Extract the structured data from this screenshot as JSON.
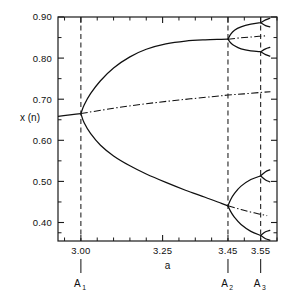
{
  "chart_data": {
    "type": "line",
    "title": "",
    "xlabel": "a",
    "ylabel": "x (n)",
    "xlim": [
      2.93,
      3.6
    ],
    "ylim": [
      0.355,
      0.9
    ],
    "grid": false,
    "legend": "none",
    "xticks_labeled": [
      "3.00",
      "3.25",
      "3.45",
      "3.55"
    ],
    "xtick_values": [
      3.0,
      3.25,
      3.45,
      3.55
    ],
    "yticks_labeled": [
      "0.90",
      "0.80",
      "0.70",
      "0.60",
      "0.50",
      "0.40"
    ],
    "ytick_values": [
      0.9,
      0.8,
      0.7,
      0.6,
      0.5,
      0.4
    ],
    "annotations": [
      {
        "label": "A",
        "sub": "1",
        "x": 3.0,
        "note": "period-1 to period-2 bifurcation"
      },
      {
        "label": "A",
        "sub": "2",
        "x": 3.45,
        "note": "period-2 to period-4 bifurcation"
      },
      {
        "label": "A",
        "sub": "3",
        "x": 3.55,
        "note": "period-4 to period-8 bifurcation"
      }
    ],
    "series": [
      {
        "name": "fixed-point-stable",
        "style": "solid",
        "points": [
          [
            2.93,
            0.658
          ],
          [
            2.96,
            0.661
          ],
          [
            2.985,
            0.6635
          ],
          [
            3.0,
            0.665
          ]
        ]
      },
      {
        "name": "fixed-point-unstable",
        "style": "dash-dot",
        "points": [
          [
            3.0,
            0.665
          ],
          [
            3.1,
            0.678
          ],
          [
            3.2,
            0.689
          ],
          [
            3.3,
            0.698
          ],
          [
            3.4,
            0.706
          ],
          [
            3.45,
            0.71
          ],
          [
            3.5,
            0.713
          ],
          [
            3.55,
            0.7165
          ],
          [
            3.58,
            0.718
          ]
        ]
      },
      {
        "name": "period2-upper-stable",
        "style": "solid",
        "points": [
          [
            3.0,
            0.665
          ],
          [
            3.01,
            0.686
          ],
          [
            3.03,
            0.714
          ],
          [
            3.06,
            0.745
          ],
          [
            3.1,
            0.776
          ],
          [
            3.15,
            0.803
          ],
          [
            3.2,
            0.8215
          ],
          [
            3.26,
            0.8345
          ],
          [
            3.32,
            0.8415
          ],
          [
            3.38,
            0.8445
          ],
          [
            3.43,
            0.8455
          ],
          [
            3.45,
            0.846
          ]
        ]
      },
      {
        "name": "period2-lower-stable",
        "style": "solid",
        "points": [
          [
            3.0,
            0.665
          ],
          [
            3.01,
            0.6425
          ],
          [
            3.03,
            0.616
          ],
          [
            3.06,
            0.588
          ],
          [
            3.1,
            0.562
          ],
          [
            3.15,
            0.538
          ],
          [
            3.2,
            0.518
          ],
          [
            3.26,
            0.4975
          ],
          [
            3.32,
            0.4785
          ],
          [
            3.38,
            0.4615
          ],
          [
            3.43,
            0.4465
          ],
          [
            3.45,
            0.4405
          ]
        ]
      },
      {
        "name": "period2-upper-unstable",
        "style": "dash-dot",
        "points": [
          [
            3.45,
            0.846
          ],
          [
            3.49,
            0.8495
          ],
          [
            3.53,
            0.852
          ],
          [
            3.57,
            0.8545
          ]
        ]
      },
      {
        "name": "period2-lower-unstable",
        "style": "dash-dot",
        "points": [
          [
            3.45,
            0.4405
          ],
          [
            3.49,
            0.4315
          ],
          [
            3.53,
            0.4235
          ],
          [
            3.57,
            0.4165
          ]
        ]
      },
      {
        "name": "period4-branch-a",
        "style": "solid",
        "points": [
          [
            3.45,
            0.846
          ],
          [
            3.458,
            0.858
          ],
          [
            3.47,
            0.868
          ],
          [
            3.49,
            0.876
          ],
          [
            3.52,
            0.8825
          ],
          [
            3.55,
            0.886
          ]
        ]
      },
      {
        "name": "period4-branch-b",
        "style": "solid",
        "points": [
          [
            3.45,
            0.846
          ],
          [
            3.458,
            0.8375
          ],
          [
            3.47,
            0.83
          ],
          [
            3.49,
            0.8225
          ],
          [
            3.52,
            0.8175
          ],
          [
            3.55,
            0.8155
          ]
        ]
      },
      {
        "name": "period4-branch-c",
        "style": "solid",
        "points": [
          [
            3.45,
            0.4405
          ],
          [
            3.458,
            0.4555
          ],
          [
            3.47,
            0.471
          ],
          [
            3.49,
            0.4885
          ],
          [
            3.52,
            0.5045
          ],
          [
            3.55,
            0.5135
          ]
        ]
      },
      {
        "name": "period4-branch-d",
        "style": "solid",
        "points": [
          [
            3.45,
            0.4405
          ],
          [
            3.458,
            0.427
          ],
          [
            3.47,
            0.4125
          ],
          [
            3.49,
            0.395
          ],
          [
            3.52,
            0.3785
          ],
          [
            3.55,
            0.3685
          ]
        ]
      },
      {
        "name": "period8-a-up",
        "style": "solid",
        "points": [
          [
            3.55,
            0.886
          ],
          [
            3.565,
            0.893
          ],
          [
            3.578,
            0.897
          ]
        ]
      },
      {
        "name": "period8-a-dn",
        "style": "solid",
        "points": [
          [
            3.55,
            0.886
          ],
          [
            3.565,
            0.879
          ],
          [
            3.578,
            0.876
          ]
        ]
      },
      {
        "name": "period8-b-up",
        "style": "solid",
        "points": [
          [
            3.55,
            0.8155
          ],
          [
            3.565,
            0.8225
          ],
          [
            3.578,
            0.826
          ]
        ]
      },
      {
        "name": "period8-b-dn",
        "style": "solid",
        "points": [
          [
            3.55,
            0.8155
          ],
          [
            3.565,
            0.8085
          ],
          [
            3.578,
            0.805
          ]
        ]
      },
      {
        "name": "period8-c-up",
        "style": "solid",
        "points": [
          [
            3.55,
            0.5135
          ],
          [
            3.565,
            0.5235
          ],
          [
            3.578,
            0.528
          ]
        ]
      },
      {
        "name": "period8-c-dn",
        "style": "solid",
        "points": [
          [
            3.55,
            0.5135
          ],
          [
            3.565,
            0.5035
          ],
          [
            3.578,
            0.499
          ]
        ]
      },
      {
        "name": "period8-d-up",
        "style": "solid",
        "points": [
          [
            3.55,
            0.3685
          ],
          [
            3.565,
            0.3775
          ],
          [
            3.578,
            0.381
          ]
        ]
      },
      {
        "name": "period8-d-dn",
        "style": "solid",
        "points": [
          [
            3.55,
            0.3685
          ],
          [
            3.565,
            0.3605
          ],
          [
            3.578,
            0.357
          ]
        ]
      }
    ]
  }
}
